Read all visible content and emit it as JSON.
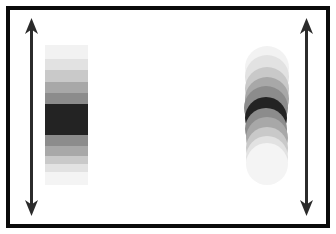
{
  "figure": {
    "width": 336,
    "height": 234,
    "background_color": "#ffffff"
  },
  "frame": {
    "name": "outer-frame",
    "border_color": "#0a0a0a",
    "border_width": 4,
    "x": 6,
    "y": 6,
    "width": 324,
    "height": 222
  },
  "arrows": [
    {
      "name": "left-double-arrow",
      "orientation": "vertical",
      "heads": "both",
      "color": "#2b2b2b",
      "x": 31,
      "y_top": 18,
      "y_bottom": 216,
      "shaft_width": 3,
      "head_width": 13,
      "head_height": 16
    },
    {
      "name": "right-double-arrow",
      "orientation": "vertical",
      "heads": "both",
      "color": "#2b2b2b",
      "x": 306,
      "y_top": 18,
      "y_bottom": 216,
      "shaft_width": 3,
      "head_width": 13,
      "head_height": 16
    }
  ],
  "band_bar": {
    "name": "gradient-band-bar",
    "shape": "rectangle",
    "x": 45,
    "y": 45,
    "width": 43,
    "height": 140,
    "bands": [
      {
        "label": "band-1",
        "color": "#f2f2f2",
        "height": 16
      },
      {
        "label": "band-2",
        "color": "#e2e2e2",
        "height": 12
      },
      {
        "label": "band-3",
        "color": "#c9c9c9",
        "height": 13
      },
      {
        "label": "band-4",
        "color": "#a8a8a8",
        "height": 13
      },
      {
        "label": "band-5",
        "color": "#8c8c8c",
        "height": 12
      },
      {
        "label": "band-6",
        "color": "#232323",
        "height": 34
      },
      {
        "label": "band-7",
        "color": "#8c8c8c",
        "height": 12
      },
      {
        "label": "band-8",
        "color": "#a8a8a8",
        "height": 12
      },
      {
        "label": "band-9",
        "color": "#c9c9c9",
        "height": 9
      },
      {
        "label": "band-10",
        "color": "#e2e2e2",
        "height": 9
      },
      {
        "label": "band-11",
        "color": "#f4f4f4",
        "height": 14
      }
    ]
  },
  "circle_stack": {
    "name": "gradient-circle-stack",
    "shape": "overlapping-circles",
    "x": 242,
    "y": 45,
    "width": 50,
    "height": 140,
    "circles": [
      {
        "label": "circle-1",
        "color": "#f2f2f2",
        "cx": 25,
        "cy": 23,
        "r": 22
      },
      {
        "label": "circle-2",
        "color": "#e2e2e2",
        "cx": 25,
        "cy": 32,
        "r": 22
      },
      {
        "label": "circle-3",
        "color": "#c9c9c9",
        "cx": 25,
        "cy": 44,
        "r": 22
      },
      {
        "label": "circle-4",
        "color": "#a8a8a8",
        "cx": 25,
        "cy": 54,
        "r": 22
      },
      {
        "label": "circle-5",
        "color": "#8c8c8c",
        "cx": 24,
        "cy": 63,
        "r": 22
      },
      {
        "label": "circle-6",
        "color": "#232323",
        "cx": 24,
        "cy": 73,
        "r": 21
      },
      {
        "label": "circle-7",
        "color": "#8c8c8c",
        "cx": 24,
        "cy": 84,
        "r": 21
      },
      {
        "label": "circle-8",
        "color": "#a8a8a8",
        "cx": 25,
        "cy": 93,
        "r": 21
      },
      {
        "label": "circle-9",
        "color": "#c9c9c9",
        "cx": 25,
        "cy": 103,
        "r": 21
      },
      {
        "label": "circle-10",
        "color": "#e2e2e2",
        "cx": 25,
        "cy": 112,
        "r": 21
      },
      {
        "label": "circle-11",
        "color": "#f4f4f4",
        "cx": 25,
        "cy": 119,
        "r": 21
      }
    ]
  }
}
